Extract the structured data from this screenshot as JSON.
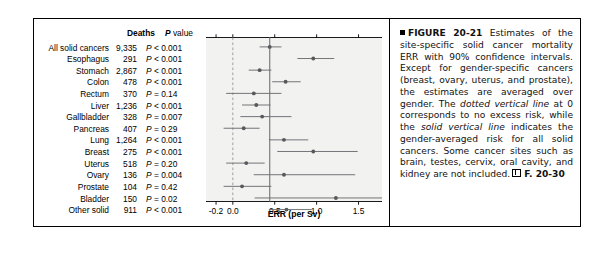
{
  "figure": {
    "table_headers": {
      "site": "",
      "deaths": "Deaths",
      "pvalue": "P value"
    },
    "axis_title": "ERR (per Sv)",
    "caption": {
      "marker": "square-bullet",
      "figure_number": "FIGURE 20-21",
      "text_1": "Estimates of the site-specific solid cancer mortality ERR with 90% confidence intervals. Except for gender-specific cancers (breast, ovary, uterus, and prostate), the estimates are averaged over gender. The ",
      "italic_1": "dotted vertical line",
      "text_2": " at 0 corresponds to no excess risk, while the ",
      "italic_2": "solid vertical line",
      "text_3": " indicates the gender-averaged risk for all solid cancers. Some cancer sites such as brain, testes, cervix, oral cavity, and kidney are not included.",
      "reference": "F. 20-30"
    },
    "colors": {
      "plot_background": "#f2f2f0",
      "marker": "#58595b",
      "interval_line": "#6d6e71",
      "solid_vline": "#808285",
      "dotted_vline": "#939598",
      "axis": "#000000"
    }
  },
  "chart_data": {
    "type": "scatter",
    "title": "",
    "xlabel": "ERR (per Sv)",
    "ylabel": "",
    "xlim": [
      -0.32,
      1.78
    ],
    "xticks": [
      -0.2,
      0.0,
      0.5,
      1.0,
      1.5
    ],
    "xticklabels": [
      "-0.2",
      "0.0",
      "0.5",
      "1.0",
      "1.5"
    ],
    "grid": false,
    "legend": "none",
    "reference_lines": [
      {
        "name": "no-excess-risk",
        "x": 0.0,
        "style": "dotted"
      },
      {
        "name": "gender-averaged-all-solid-cancers",
        "x": 0.44,
        "style": "solid"
      }
    ],
    "columns": [
      "Site",
      "Deaths",
      "P value",
      "ERR",
      "CI low",
      "CI high"
    ],
    "rows": [
      {
        "site": "All solid cancers",
        "deaths": "9,335",
        "pvalue": "P < 0.001",
        "p_rel": "<",
        "p_num": "0.001",
        "err": 0.44,
        "ci_low": 0.32,
        "ci_high": 0.58
      },
      {
        "site": "Esophagus",
        "deaths": "291",
        "pvalue": "P < 0.001",
        "p_rel": "<",
        "p_num": "0.001",
        "err": 0.96,
        "ci_low": 0.77,
        "ci_high": 1.21
      },
      {
        "site": "Stomach",
        "deaths": "2,867",
        "pvalue": "P < 0.001",
        "p_rel": "<",
        "p_num": "0.001",
        "err": 0.32,
        "ci_low": 0.19,
        "ci_high": 0.46
      },
      {
        "site": "Colon",
        "deaths": "478",
        "pvalue": "P < 0.001",
        "p_rel": "<",
        "p_num": "0.001",
        "err": 0.63,
        "ci_low": 0.47,
        "ci_high": 0.81
      },
      {
        "site": "Rectum",
        "deaths": "370",
        "pvalue": "P = 0.14",
        "p_rel": "=",
        "p_num": "0.14",
        "err": 0.25,
        "ci_low": -0.08,
        "ci_high": 0.58
      },
      {
        "site": "Liver",
        "deaths": "1,236",
        "pvalue": "P < 0.001",
        "p_rel": "<",
        "p_num": "0.001",
        "err": 0.28,
        "ci_low": 0.11,
        "ci_high": 0.45
      },
      {
        "site": "Gallbladder",
        "deaths": "328",
        "pvalue": "P = 0.007",
        "p_rel": "=",
        "p_num": "0.007",
        "err": 0.35,
        "ci_low": 0.09,
        "ci_high": 0.7
      },
      {
        "site": "Pancreas",
        "deaths": "407",
        "pvalue": "P = 0.29",
        "p_rel": "=",
        "p_num": "0.29",
        "err": 0.13,
        "ci_low": -0.11,
        "ci_high": 0.32
      },
      {
        "site": "Lung",
        "deaths": "1,264",
        "pvalue": "P < 0.001",
        "p_rel": "<",
        "p_num": "0.001",
        "err": 0.61,
        "ci_low": 0.43,
        "ci_high": 0.9
      },
      {
        "site": "Breast",
        "deaths": "275",
        "pvalue": "P < 0.001",
        "p_rel": "<",
        "p_num": "0.001",
        "err": 0.96,
        "ci_low": 0.53,
        "ci_high": 1.49
      },
      {
        "site": "Uterus",
        "deaths": "518",
        "pvalue": "P = 0.20",
        "p_rel": "=",
        "p_num": "0.20",
        "err": 0.16,
        "ci_low": -0.08,
        "ci_high": 0.38
      },
      {
        "site": "Ovary",
        "deaths": "136",
        "pvalue": "P = 0.004",
        "p_rel": "=",
        "p_num": "0.004",
        "err": 0.61,
        "ci_low": 0.25,
        "ci_high": 1.46
      },
      {
        "site": "Prostate",
        "deaths": "104",
        "pvalue": "P = 0.42",
        "p_rel": "=",
        "p_num": "0.42",
        "err": 0.11,
        "ci_low": -0.11,
        "ci_high": 0.46
      },
      {
        "site": "Bladder",
        "deaths": "150",
        "pvalue": "P = 0.02",
        "p_rel": "=",
        "p_num": "0.02",
        "err": 1.23,
        "ci_low": 0.26,
        "ci_high": 1.78
      },
      {
        "site": "Other solid",
        "deaths": "911",
        "pvalue": "P < 0.001",
        "p_rel": "<",
        "p_num": "0.001",
        "err": 0.64,
        "ci_low": 0.43,
        "ci_high": 0.94
      }
    ]
  }
}
